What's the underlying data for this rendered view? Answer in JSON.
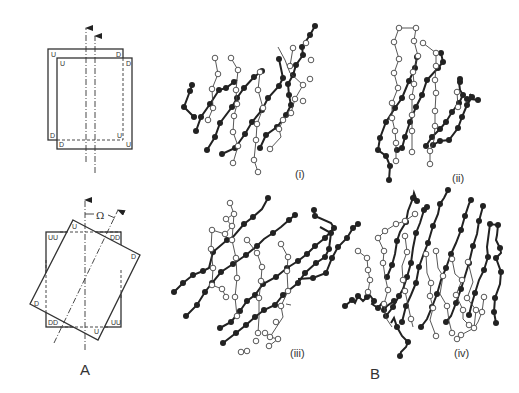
{
  "figure": {
    "panel_a": {
      "label": "A",
      "top_diagram": {
        "back_sheet_corners": {
          "top_left": "U",
          "top_right": "D",
          "bottom_left": "D",
          "bottom_right": "U"
        },
        "front_sheet_corners": {
          "top_left": "U",
          "top_right": "D",
          "bottom_left": "D",
          "bottom_right": "U"
        }
      },
      "bottom_diagram": {
        "square_corners": {
          "top_left": "UU",
          "top_right": "DD",
          "bottom_left": "DD",
          "bottom_right": "UU"
        },
        "rotated_sheet_corners": {
          "top": "U",
          "right": "D",
          "left": "D",
          "bottom": "U"
        },
        "angle_label": "Ω"
      }
    },
    "panel_b": {
      "label": "B",
      "subpanels": [
        {
          "label": "(i)"
        },
        {
          "label": "(ii)"
        },
        {
          "label": "(iii)"
        },
        {
          "label": "(iv)"
        }
      ]
    }
  }
}
